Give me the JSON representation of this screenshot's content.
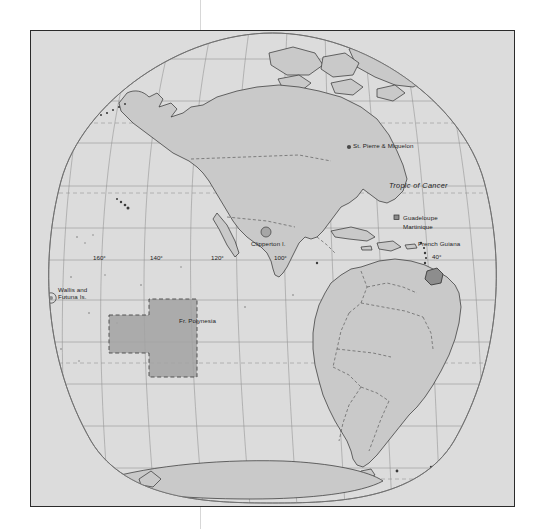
{
  "map": {
    "title": "French overseas territories in the Americas and Pacific",
    "projection": "oval-bonne",
    "frame": {
      "x": 30,
      "y": 30,
      "width": 483,
      "height": 475
    },
    "colors": {
      "ocean": "#dcdcdc",
      "land": "#c9c9c9",
      "highlight": "#9a9a9a",
      "frame_border": "#2b2b2b",
      "graticule": "#8c8c8c",
      "coastline": "#3a3a3a",
      "crop_guide": "#d7d7d7"
    },
    "place_labels": [
      {
        "name": "st-pierre-miquelon",
        "text": "St. Pierre & Miquelon",
        "x": 352,
        "y": 142,
        "marker": "dot",
        "marker_x": 350,
        "marker_y": 146
      },
      {
        "name": "tropic-of-cancer",
        "text": "Tropic of Cancer",
        "x": 388,
        "y": 183,
        "style": "italic"
      },
      {
        "name": "guadeloupe",
        "text": "Guadeloupe",
        "x": 402,
        "y": 214,
        "marker": "square",
        "marker_x": 396,
        "marker_y": 217
      },
      {
        "name": "martinique",
        "text": "Martinique",
        "x": 402,
        "y": 223
      },
      {
        "name": "french-guiana",
        "text": "French Guiana",
        "x": 417,
        "y": 240
      },
      {
        "name": "clipperton-island",
        "text": "Clipperton I.",
        "x": 250,
        "y": 240,
        "marker": "circle",
        "marker_x": 265,
        "marker_y": 231
      },
      {
        "name": "wallis-and-futuna",
        "text": "Wallis and\nFutuna Is.",
        "x": 57,
        "y": 286,
        "marker": "circle",
        "marker_x": 50,
        "marker_y": 297
      },
      {
        "name": "french-polynesia",
        "text": "Fr. Polynesia",
        "x": 178,
        "y": 317
      }
    ],
    "graticule_labels": [
      {
        "name": "lon-160w",
        "text": "160°",
        "x": 92,
        "y": 259
      },
      {
        "name": "lon-140w",
        "text": "140°",
        "x": 149,
        "y": 259
      },
      {
        "name": "lon-120w",
        "text": "120°",
        "x": 210,
        "y": 259
      },
      {
        "name": "lon-100w",
        "text": "100°",
        "x": 273,
        "y": 259
      },
      {
        "name": "lon-40w",
        "text": "40°",
        "x": 431,
        "y": 258
      }
    ],
    "highlight_regions": [
      {
        "name": "french-polynesia-extent",
        "label": "Fr. Polynesia",
        "shape": "stepped-rectangle"
      },
      {
        "name": "french-guiana-extent",
        "label": "French Guiana",
        "shape": "territory"
      }
    ]
  }
}
